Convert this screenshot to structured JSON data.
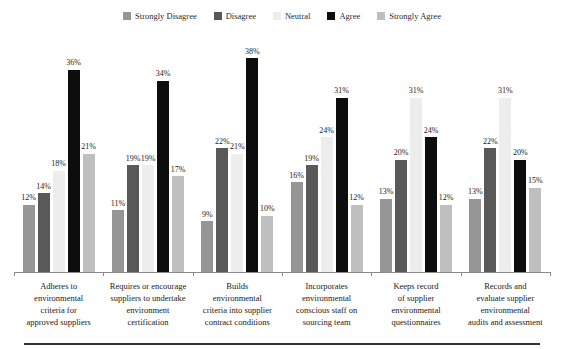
{
  "chart_data": {
    "type": "bar",
    "title": "",
    "subtitle": "",
    "xlabel": "",
    "ylabel": "",
    "ylim": [
      0,
      40
    ],
    "grid": false,
    "legend_position": "top-center",
    "value_suffix": "%",
    "categories": [
      "Adheres to environmental criteria for approved suppliers",
      "Requires or encourage suppliers to undertake environment certification",
      "Builds environmental criteria into supplier contract conditions",
      "Incorporates environmental conscious staff on sourcing team",
      "Keeps record of supplier environmental questionnaires",
      "Records and evaluate supplier environmental audits and assessment"
    ],
    "category_lines": [
      [
        "Adheres to",
        "environmental",
        "criteria for",
        "approved suppliers"
      ],
      [
        "Requires or encourage",
        "suppliers to undertake",
        "environment",
        "certification"
      ],
      [
        "Builds",
        "environmental",
        "criteria into supplier",
        "contract conditions"
      ],
      [
        "Incorporates",
        "environmental",
        "conscious staff on",
        "sourcing team"
      ],
      [
        "Keeps record",
        "of supplier",
        "environmental",
        "questionnaires"
      ],
      [
        "Records and",
        "evaluate supplier",
        "environmental",
        "audits and assessment"
      ]
    ],
    "series": [
      {
        "name": "Strongly Disagree",
        "color": "#969696",
        "values": [
          12,
          11,
          9,
          16,
          13,
          13
        ],
        "labels": [
          "12%",
          "11%",
          "9%",
          "16%",
          "13%",
          "13%"
        ]
      },
      {
        "name": "Disagree",
        "color": "#595959",
        "values": [
          14,
          19,
          22,
          19,
          20,
          22
        ],
        "labels": [
          "14%",
          "19%",
          "22%",
          "19%",
          "20%",
          "22%"
        ]
      },
      {
        "name": "Neutral",
        "color": "#ededed",
        "values": [
          18,
          19,
          21,
          24,
          31,
          31
        ],
        "labels": [
          "18%",
          "19%",
          "21%",
          "24%",
          "31%",
          "31%"
        ]
      },
      {
        "name": "Agree",
        "color": "#0d0d0d",
        "values": [
          36,
          34,
          38,
          31,
          24,
          20
        ],
        "labels": [
          "36%",
          "34%",
          "38%",
          "31%",
          "24%",
          "20%"
        ]
      },
      {
        "name": "Strongly Agree",
        "color": "#bfbfbf",
        "values": [
          21,
          17,
          10,
          12,
          12,
          15
        ],
        "labels": [
          "21%",
          "17%",
          "10%",
          "12%",
          "12%",
          "15%"
        ]
      }
    ]
  }
}
